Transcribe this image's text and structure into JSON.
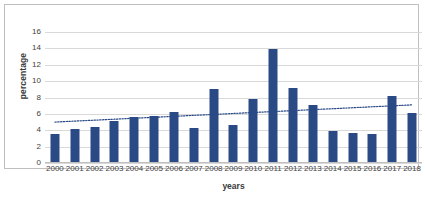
{
  "chart_data": {
    "type": "bar",
    "title": "",
    "xlabel": "years",
    "ylabel": "percentage",
    "ylim": [
      0,
      16
    ],
    "ytick_step": 2,
    "yticks": [
      16,
      14,
      12,
      10,
      8,
      6,
      4,
      2,
      0
    ],
    "grid": true,
    "legend": "none",
    "categories": [
      "2000",
      "2001",
      "2002",
      "2003",
      "2004",
      "2005",
      "2006",
      "2007",
      "2008",
      "2009",
      "2010",
      "2011",
      "2012",
      "2013",
      "2014",
      "2015",
      "2016",
      "2017",
      "2018"
    ],
    "values": [
      3.6,
      4.2,
      4.4,
      5.1,
      5.6,
      5.7,
      6.2,
      4.3,
      9.1,
      4.7,
      7.8,
      13.9,
      9.2,
      7.1,
      3.9,
      3.7,
      3.6,
      8.2,
      6.1
    ],
    "series": [
      {
        "name": "percentage",
        "type": "bar",
        "color": "#2a4a86",
        "values": [
          3.6,
          4.2,
          4.4,
          5.1,
          5.6,
          5.7,
          6.2,
          4.3,
          9.1,
          4.7,
          7.8,
          13.9,
          9.2,
          7.1,
          3.9,
          3.7,
          3.6,
          8.2,
          6.1
        ]
      },
      {
        "name": "linear trendline",
        "type": "line",
        "style": "dotted",
        "color": "#2a4a86",
        "start_value": 5.0,
        "end_value": 7.1,
        "values": [
          5.0,
          5.12,
          5.23,
          5.35,
          5.47,
          5.58,
          5.7,
          5.82,
          5.93,
          6.05,
          6.17,
          6.28,
          6.4,
          6.52,
          6.63,
          6.75,
          6.87,
          6.98,
          7.1
        ]
      }
    ],
    "colors": {
      "bar": "#2a4a86",
      "grid": "#d9d9d9",
      "border": "#bfbfbf",
      "text": "#404040"
    }
  }
}
